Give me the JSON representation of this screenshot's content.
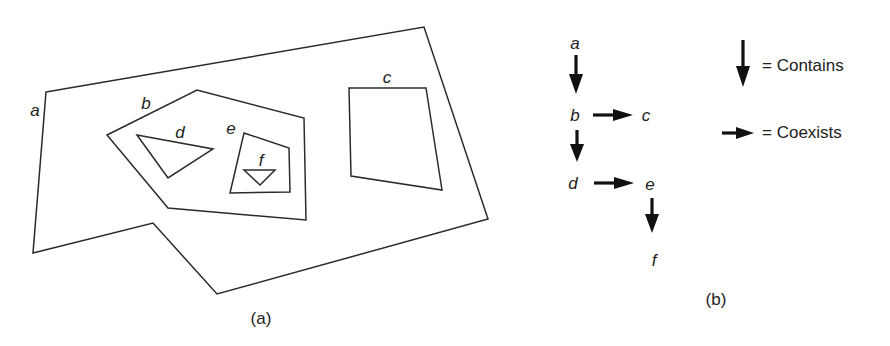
{
  "figure_a": {
    "caption": "(a)",
    "regions": [
      {
        "id": "a",
        "label": "a",
        "points": "46,92 424,27 488,219 217,294 153,223 33,253",
        "label_pos": [
          35,
          116
        ]
      },
      {
        "id": "b",
        "label": "b",
        "points": "107,135 197,90 304,118 306,220 168,208",
        "label_pos": [
          146,
          109
        ]
      },
      {
        "id": "c",
        "label": "c",
        "points": "349,88 426,88 442,190 351,176",
        "label_pos": [
          387,
          83
        ]
      },
      {
        "id": "d",
        "label": "d",
        "points": "137,135 213,149 168,178",
        "label_pos": [
          180,
          138
        ]
      },
      {
        "id": "e",
        "label": "e",
        "points": "244,133 289,148 290,192 230,193",
        "label_pos": [
          231,
          134
        ]
      },
      {
        "id": "f",
        "label": "f",
        "points": "244,170 275,170 260,185",
        "label_pos": [
          261,
          166
        ]
      }
    ]
  },
  "figure_b": {
    "caption": "(b)",
    "nodes": [
      {
        "id": "a",
        "label": "a",
        "pos": [
          575,
          49
        ]
      },
      {
        "id": "b",
        "label": "b",
        "pos": [
          575,
          121
        ]
      },
      {
        "id": "c",
        "label": "c",
        "pos": [
          646,
          121
        ]
      },
      {
        "id": "d",
        "label": "d",
        "pos": [
          573,
          189
        ]
      },
      {
        "id": "e",
        "label": "e",
        "pos": [
          650,
          190
        ]
      },
      {
        "id": "f",
        "label": "f",
        "pos": [
          654,
          266
        ]
      }
    ],
    "edges": [
      {
        "from": "a",
        "to": "b",
        "type": "contains"
      },
      {
        "from": "b",
        "to": "c",
        "type": "coexists"
      },
      {
        "from": "b",
        "to": "d",
        "type": "contains"
      },
      {
        "from": "d",
        "to": "e",
        "type": "coexists"
      },
      {
        "from": "e",
        "to": "f",
        "type": "contains"
      }
    ],
    "legend": [
      {
        "symbol": "down-arrow",
        "label": "= Contains"
      },
      {
        "symbol": "right-arrow",
        "label": "= Coexists"
      }
    ]
  }
}
